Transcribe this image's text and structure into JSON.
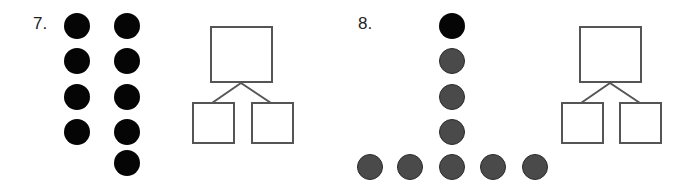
{
  "problems": [
    {
      "number": "7.",
      "dots": {
        "color": "#050505",
        "columns": [
          {
            "count": 4,
            "fill": "black"
          },
          {
            "count": 5,
            "fill": "black"
          }
        ],
        "total": 9
      },
      "number_bond": {
        "whole": "",
        "parts": [
          "",
          ""
        ]
      }
    },
    {
      "number": "8.",
      "dots": {
        "vertical": [
          {
            "fill": "black"
          },
          {
            "fill": "gray"
          },
          {
            "fill": "gray"
          },
          {
            "fill": "gray"
          }
        ],
        "horizontal": [
          {
            "fill": "gray"
          },
          {
            "fill": "gray"
          },
          {
            "fill": "gray"
          },
          {
            "fill": "gray"
          },
          {
            "fill": "gray"
          }
        ],
        "colors": {
          "black": "#050505",
          "gray": "#4a4a4a"
        },
        "total": 9
      },
      "number_bond": {
        "whole": "",
        "parts": [
          "",
          ""
        ]
      }
    }
  ]
}
